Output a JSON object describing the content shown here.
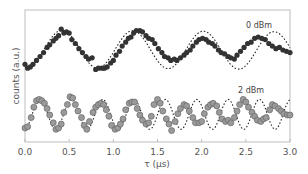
{
  "chart_data": {
    "type": "scatter",
    "title": "",
    "xlabel": "τ (μs)",
    "ylabel": "counts (a.u.)",
    "xlim": [
      0.0,
      3.0
    ],
    "ylim": [
      0,
      10
    ],
    "x_ticks": [
      "0.0",
      "0.5",
      "1.0",
      "1.5",
      "2.0",
      "2.5",
      "3.0"
    ],
    "y_ticks": [],
    "grid": false,
    "legend": "inline labels",
    "series": [
      {
        "name": "0 dBm",
        "marker": "filled-circle",
        "color": "#333333",
        "fit_style": "dotted",
        "fit": {
          "offset": 7.1,
          "amplitude": 1.45,
          "period": 0.8,
          "peak_at": 0.42,
          "slope": -0.05
        },
        "x": [
          0.0,
          0.03,
          0.06,
          0.09,
          0.13,
          0.17,
          0.21,
          0.25,
          0.28,
          0.32,
          0.35,
          0.38,
          0.41,
          0.44,
          0.47,
          0.5,
          0.53,
          0.57,
          0.61,
          0.65,
          0.69,
          0.72,
          0.76,
          0.8,
          0.83,
          0.87,
          0.9,
          0.93,
          0.97,
          1.0,
          1.03,
          1.07,
          1.1,
          1.14,
          1.17,
          1.2,
          1.23,
          1.26,
          1.3,
          1.33,
          1.37,
          1.4,
          1.44,
          1.47,
          1.51,
          1.55,
          1.58,
          1.62,
          1.65,
          1.69,
          1.72,
          1.76,
          1.8,
          1.83,
          1.87,
          1.9,
          1.94,
          1.97,
          2.01,
          2.05,
          2.08,
          2.12,
          2.15,
          2.19,
          2.22,
          2.26,
          2.3,
          2.33,
          2.37,
          2.4,
          2.44,
          2.48,
          2.52,
          2.56,
          2.6,
          2.64,
          2.68,
          2.72,
          2.76,
          2.8,
          2.84,
          2.88,
          2.92,
          2.96,
          3.0
        ],
        "y": [
          5.9,
          5.6,
          5.7,
          5.9,
          6.2,
          6.5,
          6.8,
          7.2,
          7.4,
          7.7,
          7.9,
          8.1,
          8.6,
          8.3,
          8.4,
          8.3,
          7.8,
          7.5,
          7.1,
          6.8,
          6.5,
          6.3,
          6.4,
          5.5,
          5.6,
          5.6,
          5.6,
          5.7,
          6.0,
          6.2,
          6.6,
          6.9,
          7.3,
          7.6,
          7.9,
          8.0,
          8.3,
          8.5,
          8.5,
          8.4,
          8.1,
          7.9,
          7.8,
          7.5,
          7.1,
          6.8,
          6.5,
          6.4,
          6.2,
          6.3,
          6.2,
          6.4,
          6.6,
          6.8,
          7.0,
          7.3,
          7.6,
          7.8,
          7.9,
          7.8,
          7.6,
          7.5,
          7.3,
          7.0,
          6.8,
          6.7,
          6.5,
          6.4,
          6.3,
          6.6,
          6.9,
          7.2,
          7.5,
          7.6,
          7.9,
          8.0,
          7.9,
          7.8,
          7.5,
          7.3,
          7.1,
          7.2,
          7.0,
          6.9,
          6.8
        ]
      },
      {
        "name": "2 dBm",
        "marker": "gray-circle",
        "color": "#9a9a9a",
        "edge_color": "#666666",
        "fit_style": "dotted",
        "fit": {
          "offset": 2.05,
          "amplitude": 1.15,
          "period": 0.355,
          "peak_at": 0.17,
          "slope": 0.0
        },
        "x": [
          0.0,
          0.03,
          0.07,
          0.1,
          0.13,
          0.16,
          0.19,
          0.22,
          0.25,
          0.28,
          0.32,
          0.35,
          0.38,
          0.41,
          0.44,
          0.48,
          0.51,
          0.54,
          0.57,
          0.6,
          0.64,
          0.67,
          0.7,
          0.73,
          0.77,
          0.8,
          0.83,
          0.86,
          0.89,
          0.92,
          0.95,
          0.98,
          1.02,
          1.05,
          1.08,
          1.11,
          1.14,
          1.18,
          1.21,
          1.24,
          1.27,
          1.3,
          1.33,
          1.37,
          1.4,
          1.43,
          1.46,
          1.5,
          1.53,
          1.56,
          1.6,
          1.63,
          1.66,
          1.7,
          1.73,
          1.76,
          1.8,
          1.83,
          1.86,
          1.9,
          1.93,
          1.97,
          2.0,
          2.03,
          2.07,
          2.1,
          2.13,
          2.17,
          2.2,
          2.23,
          2.27,
          2.3,
          2.33,
          2.37,
          2.4,
          2.43,
          2.47,
          2.5,
          2.53,
          2.57,
          2.6,
          2.63,
          2.67,
          2.7,
          2.73,
          2.77,
          2.8,
          2.83,
          2.87,
          2.9,
          2.93,
          2.97,
          3.0
        ],
        "y": [
          1.0,
          1.1,
          1.8,
          2.6,
          3.1,
          3.2,
          3.1,
          2.9,
          2.5,
          2.0,
          1.4,
          0.9,
          1.0,
          1.3,
          2.2,
          2.8,
          3.4,
          3.3,
          2.8,
          2.3,
          1.8,
          1.2,
          0.9,
          1.5,
          2.2,
          2.6,
          2.8,
          2.9,
          2.8,
          2.4,
          1.9,
          1.2,
          0.9,
          1.0,
          1.3,
          1.7,
          2.4,
          2.9,
          3.0,
          3.0,
          2.5,
          2.0,
          1.6,
          1.3,
          1.4,
          1.9,
          2.8,
          3.2,
          2.9,
          2.3,
          1.7,
          1.3,
          0.8,
          1.5,
          2.1,
          2.5,
          2.8,
          2.7,
          2.3,
          1.8,
          1.4,
          1.4,
          1.5,
          2.1,
          2.6,
          2.8,
          2.9,
          2.7,
          2.2,
          1.7,
          1.5,
          1.6,
          1.4,
          1.8,
          2.3,
          2.8,
          3.2,
          3.0,
          2.6,
          2.2,
          1.9,
          1.6,
          1.5,
          1.7,
          1.8,
          2.4,
          2.8,
          2.7,
          2.5,
          2.3,
          2.1,
          2.0,
          2.0
        ]
      }
    ],
    "annotations": [
      {
        "text": "0 dBm",
        "x": 2.5,
        "y": 8.9
      },
      {
        "text": "2 dBm",
        "x": 2.42,
        "y": 3.8
      }
    ]
  },
  "axes": {
    "xlabel": "τ (μs)",
    "ylabel": "counts (a.u.)",
    "x_ticks": [
      "0.0",
      "0.5",
      "1.0",
      "1.5",
      "2.0",
      "2.5",
      "3.0"
    ]
  },
  "labels": {
    "series_0": "0 dBm",
    "series_1": "2 dBm"
  }
}
